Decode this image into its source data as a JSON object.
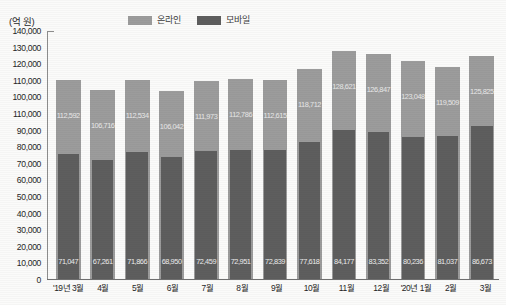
{
  "axis_title": "(억 원)",
  "legend": {
    "position": "top-center",
    "entries": [
      {
        "label": "온라인",
        "color": "#9c9c9c"
      },
      {
        "label": "모바일",
        "color": "#5e5e5e"
      }
    ]
  },
  "chart_data": {
    "type": "bar",
    "title": "",
    "subtitle": "",
    "xlabel": "",
    "ylabel": "(억 원)",
    "ylim": [
      0,
      140000
    ],
    "grid": false,
    "legend_position": "top-center",
    "categories": [
      "'19년 3월",
      "4월",
      "5월",
      "6월",
      "7월",
      "8월",
      "9월",
      "10월",
      "11월",
      "12월",
      "'20년 1월",
      "2월",
      "3월"
    ],
    "ytick_labels": [
      "140,000",
      "130,000",
      "120,000",
      "110,000",
      "100,000",
      "110,000",
      "90,000",
      "80,000",
      "70,000",
      "60,000",
      "50,000",
      "40,000",
      "30,000",
      "20,000",
      "10,000",
      "0"
    ],
    "ytick_values": [
      140000,
      130000,
      120000,
      110000,
      100000,
      95000,
      90000,
      80000,
      70000,
      60000,
      50000,
      40000,
      30000,
      20000,
      10000,
      0
    ],
    "series": [
      {
        "name": "온라인",
        "color": "#9c9c9c",
        "values": [
          112592,
          106716,
          112534,
          106042,
          111973,
          112786,
          112615,
          118712,
          128621,
          126847,
          123048,
          119509,
          125825
        ],
        "labels": [
          "112,592",
          "106,716",
          "112,534",
          "106,042",
          "111,973",
          "112,786",
          "112,615",
          "118,712",
          "128,621",
          "126,847",
          "123,048",
          "119,509",
          "125,825"
        ]
      },
      {
        "name": "모바일",
        "color": "#5e5e5e",
        "values": [
          71047,
          67261,
          71866,
          68950,
          72459,
          72951,
          72839,
          77618,
          84177,
          83352,
          80236,
          81037,
          86673
        ],
        "labels": [
          "71,047",
          "67,261",
          "71,866",
          "68,950",
          "72,459",
          "72,951",
          "72,839",
          "77,618",
          "84,177",
          "83,352",
          "80,236",
          "81,037",
          "86,673"
        ]
      }
    ]
  }
}
